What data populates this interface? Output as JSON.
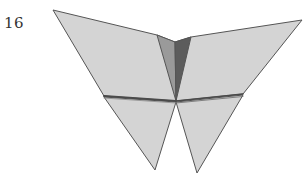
{
  "step": {
    "number": "16"
  },
  "figure": {
    "colors": {
      "paper": "#d4d4d4",
      "shade_light": "#9a9a9a",
      "shade_dark": "#5c5c5c",
      "outline": "#555555",
      "background": "#ffffff"
    }
  }
}
